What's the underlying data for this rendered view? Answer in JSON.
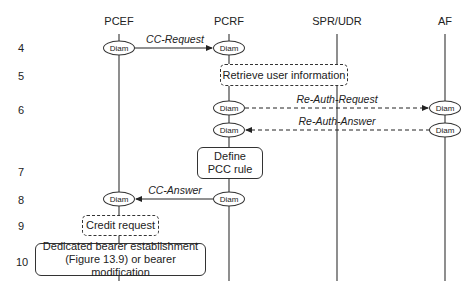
{
  "entities": [
    {
      "name": "PCEF",
      "x": 119
    },
    {
      "name": "PCRF",
      "x": 229
    },
    {
      "name": "SPR/UDR",
      "x": 337
    },
    {
      "name": "AF",
      "x": 445
    }
  ],
  "steps": [
    "4",
    "5",
    "6",
    "7",
    "8",
    "9",
    "10"
  ],
  "node_label": "Diam",
  "messages": {
    "cc_request": "CC-Request",
    "re_auth_request": "Re-Auth-Request",
    "re_auth_answer": "Re-Auth-Answer",
    "cc_answer": "CC-Answer"
  },
  "boxes": {
    "retrieve": "Retrieve user information",
    "define_line1": "Define",
    "define_line2": "PCC rule",
    "credit": "Credit request",
    "bearer_line1": "Dedicated bearer establishment",
    "bearer_line2": "(Figure 13.9) or bearer modification"
  }
}
